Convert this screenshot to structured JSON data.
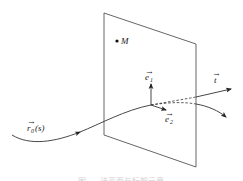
{
  "diagram": {
    "type": "frenet-frame-normal-plane",
    "colors": {
      "stroke": "#333333",
      "plane": "#555555",
      "background": "#ffffff",
      "caption": "#cfcfcf"
    },
    "plane": {
      "corners": [
        [
          104,
          13
        ],
        [
          196,
          44
        ],
        [
          196,
          167
        ],
        [
          104,
          135
        ]
      ]
    },
    "point": {
      "label": "M",
      "x": 117,
      "y": 41
    },
    "curve": {
      "label_main": "r",
      "label_sub": "0",
      "label_arg": "(s)",
      "vector_mark": "→"
    },
    "vectors": {
      "e1": {
        "label_main": "e",
        "label_sub": "1",
        "vector_mark": "→"
      },
      "e2": {
        "label_main": "e",
        "label_sub": "2",
        "vector_mark": "→"
      },
      "t": {
        "label_main": "t",
        "vector_mark": "→"
      }
    },
    "caption": {
      "text": "图 … 法平面与标架示意",
      "note": "caption truncated at bottom edge, only glyph tops visible"
    }
  }
}
